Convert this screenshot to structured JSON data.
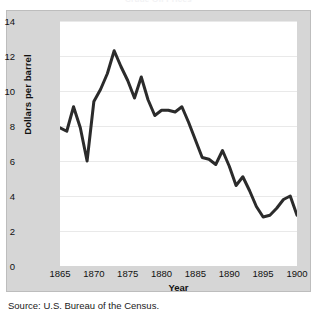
{
  "figure": {
    "title_fragment": "Crude Oil Prices",
    "source_note": "Source: U.S. Bureau of the Census."
  },
  "axes": {
    "y_title": "Dollars per barrel",
    "x_title": "Year",
    "y_ticks": [
      "0",
      "2",
      "4",
      "6",
      "8",
      "10",
      "12",
      "14"
    ],
    "x_ticks": [
      "1865",
      "1870",
      "1875",
      "1880",
      "1885",
      "1890",
      "1895",
      "1900"
    ]
  },
  "style": {
    "line_color": "#2b2b2b",
    "panel_color": "#d6d6d6",
    "plot_color": "#ffffff",
    "grid_color": "#e9e9e9"
  },
  "chart_data": {
    "type": "line",
    "title": "Crude Oil Prices",
    "xlabel": "Year",
    "ylabel": "Dollars per barrel",
    "xlim": [
      1865,
      1900
    ],
    "ylim": [
      0,
      14
    ],
    "grid": true,
    "legend": "none",
    "x": [
      1865,
      1866,
      1867,
      1868,
      1869,
      1870,
      1871,
      1872,
      1873,
      1874,
      1875,
      1876,
      1877,
      1878,
      1879,
      1880,
      1881,
      1882,
      1883,
      1884,
      1885,
      1886,
      1887,
      1888,
      1889,
      1890,
      1891,
      1892,
      1893,
      1894,
      1895,
      1896,
      1897,
      1898,
      1899,
      1900
    ],
    "values": [
      7.9,
      7.7,
      9.1,
      7.9,
      6.0,
      9.4,
      10.1,
      11.0,
      12.3,
      11.4,
      10.6,
      9.6,
      10.8,
      9.5,
      8.6,
      8.9,
      8.9,
      8.8,
      9.1,
      8.2,
      7.2,
      6.2,
      6.1,
      5.8,
      6.6,
      5.7,
      4.6,
      5.1,
      4.3,
      3.4,
      2.8,
      2.9,
      3.3,
      3.8,
      4.0,
      2.9
    ],
    "source": "Source: U.S. Bureau of the Census."
  }
}
